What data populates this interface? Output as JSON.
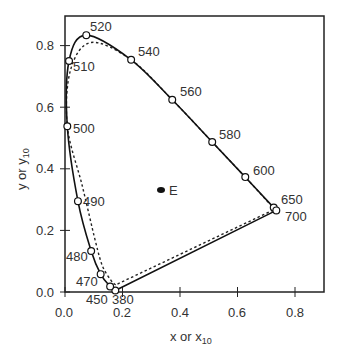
{
  "chart_data": {
    "type": "line",
    "title": "",
    "xlabel": "x or x10",
    "ylabel": "y or y10",
    "xlim": [
      0.0,
      0.9
    ],
    "ylim": [
      0.0,
      0.9
    ],
    "grid": false,
    "legend": null,
    "x_ticks": [
      "0.0",
      "0.2",
      "0.4",
      "0.6",
      "0.8"
    ],
    "y_ticks": [
      "0.0",
      "0.2",
      "0.4",
      "0.6",
      "0.8"
    ],
    "series": [
      {
        "name": "CIE 1931 spectrum locus (x, y)",
        "style": "solid",
        "points": [
          {
            "nm": 380,
            "x": 0.175,
            "y": 0.005
          },
          {
            "nm": 450,
            "x": 0.157,
            "y": 0.018
          },
          {
            "nm": 470,
            "x": 0.124,
            "y": 0.058
          },
          {
            "nm": 480,
            "x": 0.091,
            "y": 0.133
          },
          {
            "nm": 490,
            "x": 0.045,
            "y": 0.295
          },
          {
            "nm": 500,
            "x": 0.008,
            "y": 0.538
          },
          {
            "nm": 510,
            "x": 0.014,
            "y": 0.75
          },
          {
            "nm": 520,
            "x": 0.074,
            "y": 0.834
          },
          {
            "nm": 540,
            "x": 0.23,
            "y": 0.754
          },
          {
            "nm": 560,
            "x": 0.373,
            "y": 0.624
          },
          {
            "nm": 580,
            "x": 0.512,
            "y": 0.487
          },
          {
            "nm": 600,
            "x": 0.627,
            "y": 0.373
          },
          {
            "nm": 650,
            "x": 0.726,
            "y": 0.274
          },
          {
            "nm": 700,
            "x": 0.735,
            "y": 0.265
          }
        ]
      },
      {
        "name": "CIE 1964 10-degree spectrum locus (x10, y10)",
        "style": "dotted",
        "points": [
          {
            "nm": 380,
            "x": 0.176,
            "y": 0.023
          },
          {
            "nm": 450,
            "x": 0.16,
            "y": 0.038
          },
          {
            "nm": 470,
            "x": 0.131,
            "y": 0.083
          },
          {
            "nm": 480,
            "x": 0.106,
            "y": 0.164
          },
          {
            "nm": 490,
            "x": 0.06,
            "y": 0.345
          },
          {
            "nm": 500,
            "x": 0.008,
            "y": 0.538
          },
          {
            "nm": 510,
            "x": 0.019,
            "y": 0.72
          },
          {
            "nm": 520,
            "x": 0.09,
            "y": 0.81
          },
          {
            "nm": 540,
            "x": 0.23,
            "y": 0.754
          },
          {
            "nm": 560,
            "x": 0.373,
            "y": 0.624
          },
          {
            "nm": 580,
            "x": 0.512,
            "y": 0.487
          },
          {
            "nm": 600,
            "x": 0.627,
            "y": 0.373
          },
          {
            "nm": 650,
            "x": 0.72,
            "y": 0.278
          },
          {
            "nm": 700,
            "x": 0.731,
            "y": 0.269
          }
        ]
      }
    ],
    "annotations": [
      {
        "label": "E",
        "x": 0.333,
        "y": 0.333,
        "marker": "filled-ellipse"
      }
    ]
  },
  "labels": {
    "points": [
      {
        "text": "520",
        "nm": 520
      },
      {
        "text": "540",
        "nm": 540
      },
      {
        "text": "510",
        "nm": 510
      },
      {
        "text": "560",
        "nm": 560
      },
      {
        "text": "580",
        "nm": 580
      },
      {
        "text": "500",
        "nm": 500
      },
      {
        "text": "600",
        "nm": 600
      },
      {
        "text": "490",
        "nm": 490
      },
      {
        "text": "650",
        "nm": 650
      },
      {
        "text": "700",
        "nm": 700
      },
      {
        "text": "480",
        "nm": 480
      },
      {
        "text": "470",
        "nm": 470
      },
      {
        "text": "450",
        "nm": 450
      },
      {
        "text": "380",
        "nm": 380
      }
    ],
    "white_point": "E",
    "x_axis_main": "x  or  x",
    "x_axis_sub": "10",
    "y_axis_main": "y  or  y",
    "y_axis_sub": "10"
  }
}
